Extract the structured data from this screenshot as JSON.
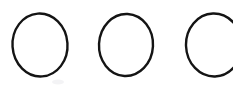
{
  "canvas": {
    "width": 233,
    "height": 93,
    "background_color": "#ffffff",
    "description": "Three hand-drawn black circle outlines in a horizontal row on a plain white background; the rightmost circle is clipped by the right edge of the image."
  },
  "style": {
    "stroke_color": "#141414",
    "stroke_width": 2.4,
    "fill": "none",
    "smudge_color": "#e9e9ec"
  },
  "shapes": [
    {
      "name": "circle-1",
      "kind": "ellipse",
      "cx": 40,
      "cy": 45,
      "rx": 27.5,
      "ry": 31.5,
      "rotation": -4,
      "clipped": false
    },
    {
      "name": "circle-2",
      "cx": 126,
      "cy": 45,
      "kind": "ellipse",
      "rx": 27,
      "ry": 31,
      "rotation": 3,
      "clipped": false
    },
    {
      "name": "circle-3",
      "kind": "ellipse",
      "cx": 214,
      "cy": 45,
      "rx": 28,
      "ry": 31.5,
      "rotation": -2,
      "clipped": true
    }
  ],
  "marks": [
    {
      "name": "smudge",
      "cx": 58,
      "cy": 82,
      "rx": 6,
      "ry": 2.5
    }
  ]
}
